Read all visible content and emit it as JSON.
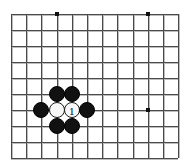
{
  "diagram": {
    "kind": "go-board-diagram",
    "board": {
      "columns": 12,
      "rows": 10,
      "origin_x": 11,
      "origin_y": 14,
      "spacing_x": 15.2,
      "spacing_y": 16,
      "line_color": "#4a4a4a",
      "line_color_light": "#bdbdbd",
      "background_color": "#ffffff",
      "border_color": "#4a4a4a"
    },
    "star_points": [
      {
        "name": "star-point-top-left",
        "col": 3,
        "row": 0
      },
      {
        "name": "star-point-top-right",
        "col": 9,
        "row": 0
      },
      {
        "name": "star-point-right",
        "col": 9,
        "row": 6
      }
    ],
    "star_point_color": "#111111",
    "star_point_size": 4,
    "stone_radius": 8,
    "stones": [
      {
        "name": "stone-black-1",
        "color": "black",
        "col": 3,
        "row": 5,
        "label": ""
      },
      {
        "name": "stone-black-2",
        "color": "black",
        "col": 4,
        "row": 5,
        "label": ""
      },
      {
        "name": "stone-black-3",
        "color": "black",
        "col": 2,
        "row": 6,
        "label": ""
      },
      {
        "name": "stone-white-1",
        "color": "white",
        "col": 3,
        "row": 6,
        "label": ""
      },
      {
        "name": "stone-white-2",
        "color": "white",
        "col": 4,
        "row": 6,
        "label": "1"
      },
      {
        "name": "stone-black-4",
        "color": "black",
        "col": 5,
        "row": 6,
        "label": ""
      },
      {
        "name": "stone-black-5",
        "color": "black",
        "col": 3,
        "row": 7,
        "label": ""
      },
      {
        "name": "stone-black-6",
        "color": "black",
        "col": 4,
        "row": 7,
        "label": ""
      }
    ],
    "move_label_color": "#000000",
    "move_label_size": 11
  }
}
